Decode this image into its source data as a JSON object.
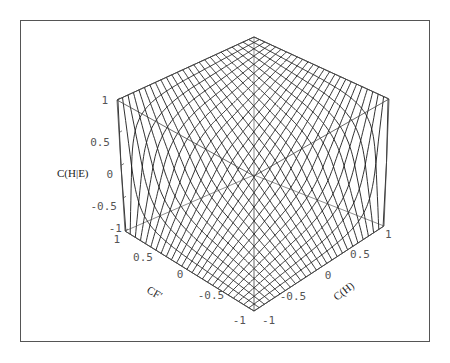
{
  "chart_data": {
    "type": "surface3d",
    "title": "",
    "xlabel": "C(H)",
    "ylabel": "CF'",
    "zlabel": "C(H|E)",
    "xlim": [
      -1,
      1
    ],
    "ylim": [
      -1,
      1
    ],
    "zlim": [
      -1,
      1
    ],
    "x_ticks": [
      "-1",
      "-0.5",
      "0",
      "0.5",
      "1"
    ],
    "y_ticks": [
      "-1",
      "-0.5",
      "0",
      "0.5",
      "1"
    ],
    "z_ticks": [
      "-1",
      "-0.5",
      "0",
      "0.5",
      "1"
    ],
    "mesh_divisions": 25,
    "function": "certainty-factor combination: x+y-xy if x,y>=0; x+y+xy if x,y<=0; (x+y)/(1-min(|x|,|y|)) otherwise",
    "style": "wireframe mesh, black lines on white, bounding box shown",
    "grid": false,
    "legend": null,
    "sample_points": [
      {
        "C(H)": -1,
        "CF'": -1,
        "C(H|E)": -1
      },
      {
        "C(H)": 1,
        "CF'": 1,
        "C(H|E)": 1
      },
      {
        "C(H)": 0,
        "CF'": 0,
        "C(H|E)": 0
      },
      {
        "C(H)": 1,
        "CF'": -1,
        "C(H|E)": 0
      },
      {
        "C(H)": -1,
        "CF'": 1,
        "C(H|E)": 0
      },
      {
        "C(H)": 0.5,
        "CF'": 0.5,
        "C(H|E)": 0.75
      },
      {
        "C(H)": -0.5,
        "CF'": -0.5,
        "C(H|E)": -0.75
      }
    ]
  },
  "axes": {
    "z": {
      "label": "C(H|E)",
      "ticks": [
        "1",
        "0.5",
        "0",
        "-0.5",
        "-1"
      ]
    },
    "y": {
      "label": "CF'",
      "ticks": [
        "1",
        "0.5",
        "0",
        "-0.5",
        "-1"
      ]
    },
    "x": {
      "label": "C(H)",
      "ticks": [
        "-1",
        "-0.5",
        "0",
        "0.5",
        "1"
      ]
    }
  },
  "colors": {
    "mesh": "#1a1a1a",
    "box": "#444444",
    "frame": "#555555",
    "background": "#ffffff"
  }
}
